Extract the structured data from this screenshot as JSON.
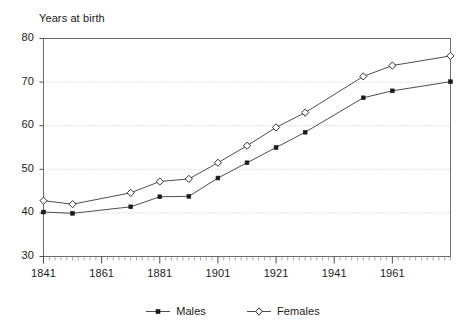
{
  "chart_data": {
    "type": "line",
    "title": "Years at birth",
    "xlabel": "",
    "ylabel": "Years at birth",
    "xlim": [
      1841,
      1981
    ],
    "ylim": [
      30,
      80
    ],
    "ytick_labels": [
      "30",
      "40",
      "50",
      "60",
      "70",
      "80"
    ],
    "yticks": [
      30,
      40,
      50,
      60,
      70,
      80
    ],
    "xtick_labels": [
      "1841",
      "1861",
      "1881",
      "1901",
      "1921",
      "1941",
      "1961"
    ],
    "xticks": [
      1841,
      1861,
      1881,
      1901,
      1921,
      1941,
      1961
    ],
    "minor_xtick_interval": 2,
    "grid": "horizontal-dotted",
    "legend_position": "bottom-center",
    "series": [
      {
        "name": "Males",
        "marker": "filled-square",
        "x": [
          1841,
          1851,
          1871,
          1881,
          1891,
          1901,
          1911,
          1921,
          1931,
          1951,
          1961,
          1981
        ],
        "values": [
          40.2,
          39.9,
          41.4,
          43.7,
          43.8,
          48.0,
          51.5,
          55.0,
          58.5,
          66.4,
          68.0,
          70.1
        ]
      },
      {
        "name": "Females",
        "marker": "open-diamond",
        "x": [
          1841,
          1851,
          1871,
          1881,
          1891,
          1901,
          1911,
          1921,
          1931,
          1951,
          1961,
          1981
        ],
        "values": [
          42.8,
          42.0,
          44.6,
          47.2,
          47.8,
          51.5,
          55.4,
          59.6,
          63.0,
          71.3,
          73.8,
          76.0
        ]
      }
    ]
  },
  "legend": {
    "items": [
      {
        "label": "Males"
      },
      {
        "label": "Females"
      }
    ]
  },
  "colors": {
    "line": "#3a3a3a",
    "grid": "#b9b9b9",
    "frame": "#6b6b6b",
    "text": "#1a1a1a",
    "background": "#ffffff"
  }
}
